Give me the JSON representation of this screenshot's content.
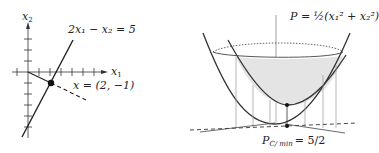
{
  "left_panel": {
    "y_axis_label": "x",
    "y_axis_sub": "2",
    "x_axis_label": "x",
    "x_axis_sub": "1",
    "constraint_line_label": "2x₁ − x₂ = 5",
    "point_label": "x = (2, −1)",
    "point": [
      2,
      -1
    ]
  },
  "right_panel": {
    "surface_label": "P = ½(x₁² + x₂²)",
    "min_label": "P",
    "min_sub": "C/ min",
    "min_value": "= 5/2"
  },
  "colors": {
    "ink": "#222222",
    "shade": "#e4e4e4",
    "thin": "#888888"
  }
}
